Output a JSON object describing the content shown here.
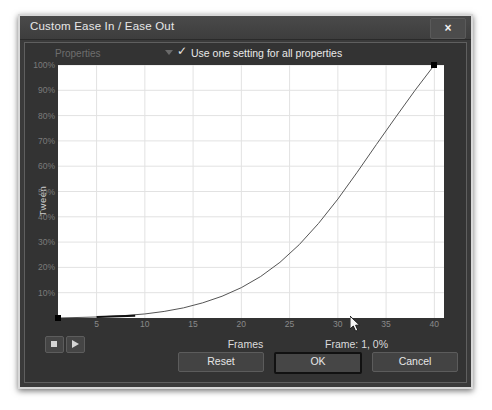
{
  "window": {
    "title": "Custom Ease In / Ease Out",
    "close_label": "×"
  },
  "toolbar": {
    "properties_label": "Properties",
    "properties_arrow_icon": "chevron-down-icon",
    "use_one_setting_label": "Use one setting for all properties",
    "use_one_setting_checked": true,
    "check_glyph": "✓"
  },
  "graph": {
    "y_axis_title": "Tween",
    "x_axis_title": "Frames"
  },
  "transport": {
    "stop_label": "Stop",
    "play_label": "Play"
  },
  "status": {
    "text": "Frame:  1,    0%"
  },
  "buttons": {
    "reset": "Reset",
    "ok": "OK",
    "cancel": "Cancel"
  },
  "colors": {
    "dialog_bg": "#333333",
    "titlebar_bg": "#4a4a4a",
    "plot_bg": "#ffffff",
    "curve": "#555555",
    "handle": "#000000",
    "grid": "#e2e2e2",
    "text": "#e6e6e6"
  },
  "chart_data": {
    "type": "line",
    "title": "",
    "xlabel": "Frames",
    "ylabel": "Tween",
    "xlim": [
      1,
      41
    ],
    "ylim": [
      0,
      100
    ],
    "grid": true,
    "legend": null,
    "xticks": [
      5,
      10,
      15,
      20,
      25,
      30,
      35,
      40
    ],
    "yticks": [
      10,
      20,
      30,
      40,
      50,
      60,
      70,
      80,
      90,
      100
    ],
    "ytick_labels": [
      "10%",
      "20%",
      "30%",
      "40%",
      "50%",
      "60%",
      "70%",
      "80%",
      "90%",
      "100%"
    ],
    "series": [
      {
        "name": "Ease curve",
        "x": [
          1,
          5,
          8,
          10,
          12,
          14,
          16,
          18,
          20,
          22,
          24,
          26,
          28,
          30,
          32,
          34,
          36,
          38,
          40
        ],
        "y": [
          0,
          0.4,
          1.0,
          1.6,
          2.6,
          4.0,
          6.0,
          8.6,
          12.0,
          16.4,
          22.0,
          29.0,
          37.4,
          47.0,
          57.6,
          68.6,
          79.4,
          90.0,
          100
        ]
      }
    ],
    "control_points": [
      {
        "frame": 1,
        "percent": 0,
        "selected": true
      },
      {
        "frame": 40,
        "percent": 100,
        "selected": true
      }
    ],
    "annotations": [
      "Frame:  1,    0%"
    ]
  }
}
